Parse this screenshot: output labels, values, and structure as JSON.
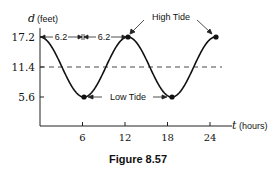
{
  "chart_data": {
    "type": "line",
    "title": "",
    "caption": "Figure 8.57",
    "xlabel_var": "t",
    "xlabel_unit": "(hours)",
    "ylabel_var": "d",
    "ylabel_unit": "(feet)",
    "xticks": [
      6,
      12,
      18,
      24
    ],
    "yticks": [
      17.2,
      11.4,
      5.6
    ],
    "xlim": [
      0,
      25.5
    ],
    "ylim": [
      5.6,
      17.2
    ],
    "grid": false,
    "midline": {
      "value": 11.4,
      "style": "dashed"
    },
    "function": "d = 11.4 + 5.8*cos(2*pi*t/12.4)",
    "period_hours": 12.4,
    "amplitude_feet": 5.8,
    "series": [
      {
        "name": "tide depth",
        "x": [
          0,
          3.1,
          6.2,
          9.3,
          12.4,
          15.5,
          18.6,
          21.7,
          24.8
        ],
        "y": [
          17.2,
          11.4,
          5.6,
          11.4,
          17.2,
          11.4,
          5.6,
          11.4,
          17.2
        ]
      }
    ],
    "marked_points": [
      {
        "t": 6.2,
        "d": 5.6,
        "label": "Low Tide"
      },
      {
        "t": 12.4,
        "d": 17.2,
        "label": "High Tide"
      },
      {
        "t": 18.6,
        "d": 5.6,
        "label": "Low Tide"
      },
      {
        "t": 24.8,
        "d": 17.2,
        "label": "High Tide"
      }
    ],
    "annotations": [
      {
        "text": "High Tide",
        "points_to": [
          12.4,
          24.8
        ]
      },
      {
        "text": "Low Tide",
        "points_to": [
          6.2,
          18.6
        ]
      },
      {
        "text": "6.2",
        "span": [
          0,
          6.2
        ]
      },
      {
        "text": "6.2",
        "span": [
          6.2,
          12.4
        ]
      }
    ]
  },
  "labels": {
    "y_var": "d",
    "y_unit": "(feet)",
    "x_var": "t",
    "x_unit": "(hours)",
    "ytick_top": "17.2",
    "ytick_mid": "11.4",
    "ytick_low": "5.6",
    "xtick_6": "6",
    "xtick_12": "12",
    "xtick_18": "18",
    "xtick_24": "24",
    "span_1": "6.2",
    "span_2": "6.2",
    "high_tide": "High Tide",
    "low_tide": "Low Tide",
    "caption": "Figure 8.57"
  }
}
